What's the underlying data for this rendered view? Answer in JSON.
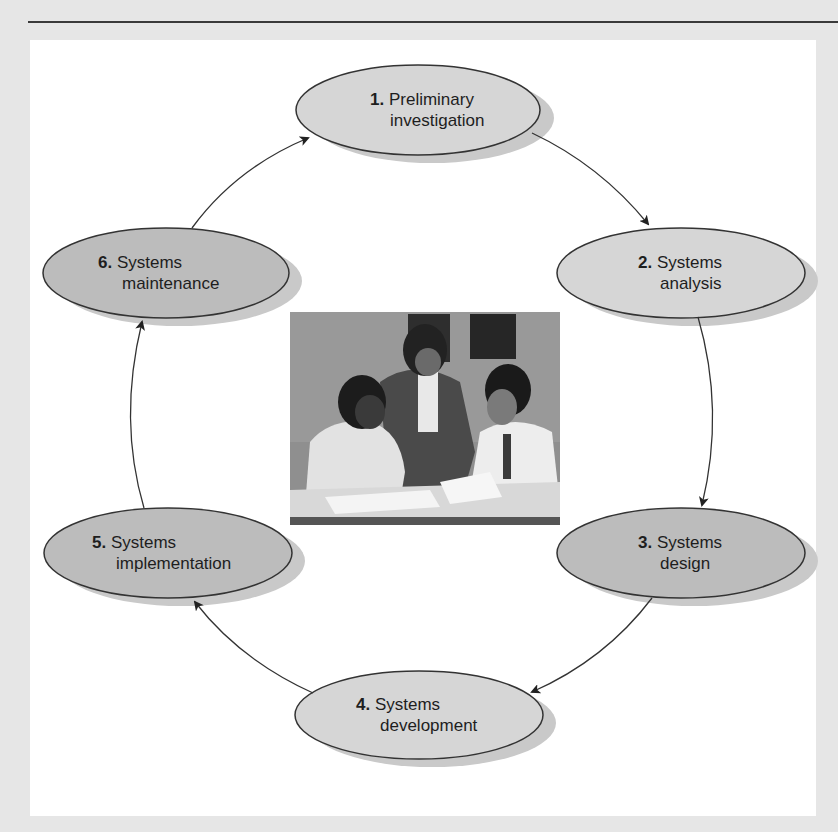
{
  "figure": {
    "colors": {
      "background": "#e6e6e6",
      "panel": "#ffffff",
      "rule": "#3a3a3a",
      "ellipse_light": "#d6d6d6",
      "ellipse_dark": "#bcbcbc",
      "shadow": "#c9c9c9",
      "stroke": "#333333",
      "text": "#1e1e1e"
    },
    "stages": [
      {
        "number": "1.",
        "line1": "Preliminary",
        "line2": "investigation",
        "shade": "light"
      },
      {
        "number": "2.",
        "line1": "Systems",
        "line2": "analysis",
        "shade": "light"
      },
      {
        "number": "3.",
        "line1": "Systems",
        "line2": "design",
        "shade": "dark"
      },
      {
        "number": "4.",
        "line1": "Systems",
        "line2": "development",
        "shade": "light"
      },
      {
        "number": "5.",
        "line1": "Systems",
        "line2": "implementation",
        "shade": "dark"
      },
      {
        "number": "6.",
        "line1": "Systems",
        "line2": "maintenance",
        "shade": "dark"
      }
    ],
    "flow": [
      "1 → 2",
      "2 → 3",
      "3 → 4",
      "4 → 5",
      "5 → 6",
      "6 → 1"
    ],
    "center_image": "photo of three people reviewing documents at a table"
  }
}
